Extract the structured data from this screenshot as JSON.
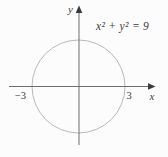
{
  "figure": {
    "equation": "x² + y² = 9",
    "axes": {
      "x_label": "x",
      "y_label": "y"
    },
    "ticks": {
      "x_negative": "−3",
      "x_positive": "3"
    },
    "graph": {
      "shape": "circle",
      "center_x": 0,
      "center_y": 0,
      "radius": 3,
      "x_intercepts": [
        -3,
        3
      ]
    },
    "colors": {
      "background": "#fcfcfc",
      "axis": "#6e6e6e",
      "arrow": "#3a3a3a",
      "circle_stroke": "#b9b9b9",
      "text": "#3e3e3e"
    }
  }
}
